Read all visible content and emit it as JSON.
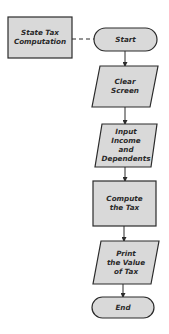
{
  "diagram": {
    "type": "flowchart",
    "fill_color": "#d9d9d9",
    "stroke_color": "#2b2b2b",
    "module": {
      "lines": [
        "State Tax",
        "Computation"
      ]
    },
    "nodes": [
      {
        "id": "start",
        "shape": "terminal",
        "lines": [
          "Start"
        ]
      },
      {
        "id": "clear",
        "shape": "io",
        "lines": [
          "Clear",
          "Screen"
        ]
      },
      {
        "id": "input",
        "shape": "io",
        "lines": [
          "Input",
          "Income",
          "and",
          "Dependents"
        ]
      },
      {
        "id": "compute",
        "shape": "process",
        "lines": [
          "Compute",
          "the Tax"
        ]
      },
      {
        "id": "print",
        "shape": "io",
        "lines": [
          "Print",
          "the Value",
          "of Tax"
        ]
      },
      {
        "id": "end",
        "shape": "terminal",
        "lines": [
          "End"
        ]
      }
    ],
    "edges": [
      {
        "from": "module",
        "to": "start",
        "style": "dashed"
      },
      {
        "from": "start",
        "to": "clear"
      },
      {
        "from": "clear",
        "to": "input"
      },
      {
        "from": "input",
        "to": "compute"
      },
      {
        "from": "compute",
        "to": "print"
      },
      {
        "from": "print",
        "to": "end"
      }
    ]
  }
}
